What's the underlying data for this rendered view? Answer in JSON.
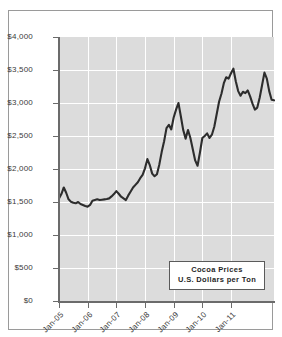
{
  "legend": {
    "line1": "Cocoa Prices",
    "line2": "U.S. Dollars per Ton"
  },
  "axis": {
    "y_ticks": [
      "$0",
      "$500",
      "$1,000",
      "$1,500",
      "$2,000",
      "$2,500",
      "$3,000",
      "$3,500",
      "$4,000"
    ],
    "x_ticks": [
      "Jan-05",
      "Jan-06",
      "Jan-07",
      "Jan-08",
      "Jan-09",
      "Jan-10",
      "Jan-11"
    ]
  },
  "colors": {
    "plot_background": "#dcdcdc",
    "gridline": "#ffffff",
    "axis": "#6b6b6b",
    "series": "#2d2d2d",
    "frame": "#9a9a9a",
    "page_background": "#ffffff"
  },
  "chart_data": {
    "type": "line",
    "title": "Cocoa Prices",
    "subtitle": "U.S. Dollars per Ton",
    "xlabel": "",
    "ylabel": "",
    "ylim": [
      0,
      4000
    ],
    "ytick_step": 500,
    "grid": true,
    "legend_position": "inside-bottom-center",
    "x_axis_type": "monthly",
    "x_start": "Jan-05",
    "x_end": "Jul-11",
    "x_tick_labels": [
      "Jan-05",
      "Jan-06",
      "Jan-07",
      "Jan-08",
      "Jan-09",
      "Jan-10",
      "Jan-11"
    ],
    "x_tick_indices": [
      0,
      12,
      24,
      36,
      48,
      60,
      72
    ],
    "series": [
      {
        "name": "Cocoa Prices (USD per Ton)",
        "values": [
          1555,
          1620,
          1720,
          1640,
          1540,
          1505,
          1490,
          1480,
          1500,
          1470,
          1455,
          1440,
          1430,
          1455,
          1520,
          1530,
          1540,
          1530,
          1535,
          1540,
          1545,
          1555,
          1585,
          1620,
          1665,
          1625,
          1580,
          1555,
          1530,
          1600,
          1660,
          1720,
          1760,
          1800,
          1860,
          1910,
          2010,
          2150,
          2060,
          1930,
          1890,
          1920,
          2070,
          2260,
          2420,
          2620,
          2670,
          2600,
          2780,
          2900,
          3000,
          2800,
          2590,
          2460,
          2590,
          2470,
          2300,
          2130,
          2050,
          2250,
          2470,
          2500,
          2540,
          2470,
          2520,
          2640,
          2830,
          3020,
          3140,
          3300,
          3390,
          3370,
          3450,
          3520,
          3330,
          3180,
          3110,
          3170,
          3150,
          3190,
          3100,
          2990,
          2900,
          2930,
          3080,
          3270,
          3460,
          3370,
          3180,
          3050,
          3040
        ]
      }
    ],
    "annotations": [
      {
        "label": "start value",
        "x": "Jan-05",
        "y": 1555
      },
      {
        "label": "early peak",
        "x": "Mar-05",
        "y": 1720
      },
      {
        "label": "low",
        "x": "Jan-06",
        "y": 1430
      },
      {
        "label": "mid-2008 peak",
        "x": "Jul-08",
        "y": 3000
      },
      {
        "label": "late-2008 trough",
        "x": "Dec-08",
        "y": 2050
      },
      {
        "label": "2010 peak",
        "x": "Feb-10",
        "y": 3520
      },
      {
        "label": "2011 peak",
        "x": "Mar-11",
        "y": 3460
      },
      {
        "label": "end value",
        "x": "Jul-11",
        "y": 3040
      }
    ]
  }
}
